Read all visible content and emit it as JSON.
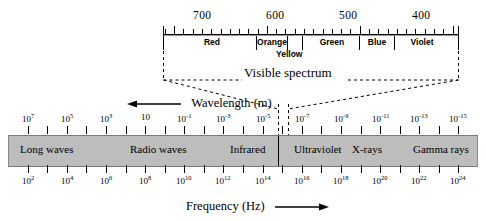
{
  "figure": {
    "visible_spectrum_caption": "Visible spectrum",
    "wavelength_axis_label": "Wavelength (m)",
    "wavelength_arrow": "left-arrow",
    "frequency_axis_label": "Frequency (Hz)",
    "frequency_arrow": "right-arrow"
  },
  "visible": {
    "wavelength_ticks_nm": [
      700,
      600,
      500,
      400
    ],
    "tick_labels": [
      "700",
      "600",
      "500",
      "400"
    ],
    "colors": [
      {
        "name": "Red",
        "label": "Red"
      },
      {
        "name": "Orange",
        "label": "Orange"
      },
      {
        "name": "Yellow",
        "label": "Yellow"
      },
      {
        "name": "Green",
        "label": "Green"
      },
      {
        "name": "Blue",
        "label": "Blue"
      },
      {
        "name": "Violet",
        "label": "Violet"
      }
    ]
  },
  "wavelength": {
    "unit": "m",
    "tick_labels": [
      "10⁷",
      "10⁵",
      "10³",
      "10",
      "10⁻¹",
      "10⁻³",
      "10⁻⁵",
      "10⁻⁷",
      "10⁻⁹",
      "10⁻¹¹",
      "10⁻¹³",
      "10⁻¹⁵"
    ],
    "exponents": [
      7,
      5,
      3,
      1,
      -1,
      -3,
      -5,
      -7,
      -9,
      -11,
      -13,
      -15
    ]
  },
  "frequency": {
    "unit": "Hz",
    "tick_labels": [
      "10²",
      "10⁴",
      "10⁶",
      "10⁸",
      "10¹⁰",
      "10¹²",
      "10¹⁴",
      "10¹⁶",
      "10¹⁸",
      "10²⁰",
      "10²²",
      "10²⁴"
    ],
    "exponents": [
      2,
      4,
      6,
      8,
      10,
      12,
      14,
      16,
      18,
      20,
      22,
      24
    ]
  },
  "bands": [
    {
      "name": "long-waves",
      "label": "Long waves"
    },
    {
      "name": "radio-waves",
      "label": "Radio waves"
    },
    {
      "name": "infrared",
      "label": "Infrared"
    },
    {
      "name": "ultraviolet",
      "label": "Ultraviolet"
    },
    {
      "name": "xrays",
      "label": "X-rays"
    },
    {
      "name": "gamma-rays",
      "label": "Gamma rays"
    }
  ],
  "colors_hex": {
    "bar_fill": "#bdbdbd",
    "bar_edge": "#7a7a7a",
    "ink": "#000000",
    "background": "#ffffff"
  },
  "chart_data": {
    "type": "diagram",
    "xlabel_top": "Wavelength (m)",
    "xlabel_bottom": "Frequency (Hz)",
    "wavelength_exponent_range": [
      7,
      -15
    ],
    "frequency_exponent_range": [
      2,
      24
    ],
    "grid": false,
    "legend": "none",
    "bands": [
      {
        "label": "Long waves",
        "wavelength_exponent_range": [
          7,
          2
        ]
      },
      {
        "label": "Radio waves",
        "wavelength_exponent_range": [
          2,
          -3
        ]
      },
      {
        "label": "Infrared",
        "wavelength_exponent_range": [
          -3,
          -6.3
        ]
      },
      {
        "label": "Ultraviolet",
        "wavelength_exponent_range": [
          -6.6,
          -8
        ]
      },
      {
        "label": "X-rays",
        "wavelength_exponent_range": [
          -8,
          -11
        ]
      },
      {
        "label": "Gamma rays",
        "wavelength_exponent_range": [
          -11,
          -15
        ]
      }
    ],
    "visible_colors": [
      {
        "label": "Red",
        "nm_range": [
          700,
          620
        ]
      },
      {
        "label": "Orange",
        "nm_range": [
          620,
          592
        ]
      },
      {
        "label": "Yellow",
        "nm_range": [
          592,
          578
        ]
      },
      {
        "label": "Green",
        "nm_range": [
          578,
          505
        ]
      },
      {
        "label": "Blue",
        "nm_range": [
          505,
          455
        ]
      },
      {
        "label": "Violet",
        "nm_range": [
          455,
          400
        ]
      }
    ]
  }
}
